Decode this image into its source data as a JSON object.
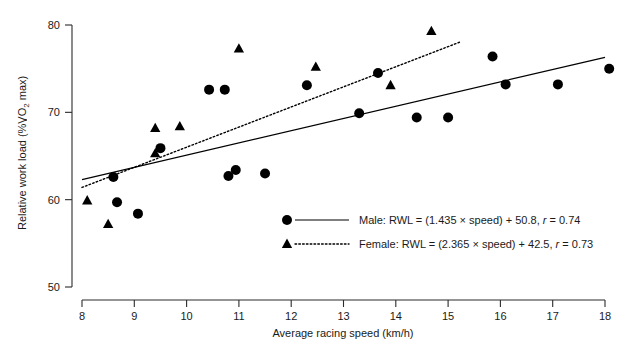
{
  "chart_data": {
    "type": "scatter",
    "title": "",
    "xlabel": "Average racing speed (km/h)",
    "ylabel": "Relative work load (%VO2 max)",
    "ylabel_parts": {
      "prefix": "Relative work load (%",
      "vdot": "V",
      "o": "O",
      "sub": "2",
      "suffix": " max)"
    },
    "xlim": [
      8,
      18
    ],
    "ylim": [
      50,
      80
    ],
    "xticks": [
      8,
      9,
      10,
      11,
      12,
      13,
      14,
      15,
      16,
      17,
      18
    ],
    "yticks": [
      50,
      60,
      70,
      80
    ],
    "grid": false,
    "legend_position": "inside-bottom-center",
    "series": [
      {
        "name": "Male",
        "marker": "circle",
        "line_style": "solid",
        "legend_label": "Male: RWL = (1.435 × speed) + 50.8, r = 0.74",
        "equation_slope": 1.435,
        "equation_intercept": 50.8,
        "r": 0.74,
        "fit_x": [
          8,
          18
        ],
        "fit_y": [
          62.3,
          76.3
        ],
        "points": [
          [
            8.67,
            59.7
          ],
          [
            9.07,
            58.4
          ],
          [
            8.6,
            62.6
          ],
          [
            9.5,
            65.9
          ],
          [
            10.43,
            72.6
          ],
          [
            10.73,
            72.6
          ],
          [
            10.8,
            62.7
          ],
          [
            10.94,
            63.4
          ],
          [
            11.5,
            63.0
          ],
          [
            12.3,
            73.1
          ],
          [
            13.3,
            69.9
          ],
          [
            13.66,
            74.5
          ],
          [
            14.4,
            69.4
          ],
          [
            15.0,
            69.4
          ],
          [
            15.85,
            76.4
          ],
          [
            16.1,
            73.2
          ],
          [
            17.1,
            73.2
          ],
          [
            18.08,
            75.0
          ]
        ]
      },
      {
        "name": "Female",
        "marker": "triangle",
        "line_style": "dotted",
        "legend_label": "Female: RWL = (2.365 × speed) + 42.5, r = 0.73",
        "equation_slope": 2.365,
        "equation_intercept": 42.5,
        "r": 0.73,
        "fit_x": [
          8,
          15.25
        ],
        "fit_y": [
          61.4,
          78.1
        ],
        "points": [
          [
            8.1,
            59.9
          ],
          [
            8.5,
            57.2
          ],
          [
            9.4,
            68.2
          ],
          [
            9.4,
            65.3
          ],
          [
            9.87,
            68.4
          ],
          [
            11.0,
            77.3
          ],
          [
            12.47,
            75.2
          ],
          [
            13.9,
            73.1
          ],
          [
            14.68,
            79.3
          ]
        ]
      }
    ],
    "legend_entries": [
      {
        "marker": "circle",
        "line_style": "solid",
        "label_plain": "Male: RWL = (1.435 × speed) + 50.8, ",
        "label_italic": "r",
        "label_tail": " = 0.74"
      },
      {
        "marker": "triangle",
        "line_style": "dotted",
        "label_plain": "Female: RWL = (2.365 × speed) + 42.5, ",
        "label_italic": "r",
        "label_tail": " = 0.73"
      }
    ]
  }
}
